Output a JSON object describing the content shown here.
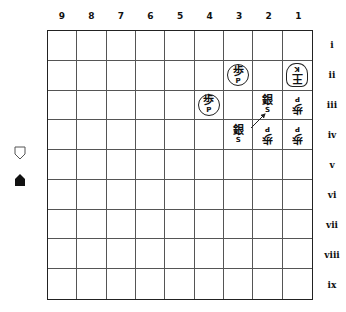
{
  "board": {
    "files": [
      "9",
      "8",
      "7",
      "6",
      "5",
      "4",
      "3",
      "2",
      "1"
    ],
    "ranks": [
      "i",
      "ii",
      "iii",
      "iv",
      "v",
      "vi",
      "vii",
      "viii",
      "ix"
    ],
    "pieces": {
      "1-ii": {
        "kanji": "王",
        "latin": "K",
        "side": "gote",
        "type": "king"
      },
      "3-ii": {
        "kanji": "歩",
        "latin": "P",
        "side": "sente",
        "type": "pawn",
        "circled": true
      },
      "4-iii": {
        "kanji": "歩",
        "latin": "P",
        "side": "sente",
        "type": "pawn",
        "circled": true
      },
      "2-iii": {
        "kanji": "銀",
        "latin": "S",
        "side": "sente",
        "type": "silver"
      },
      "1-iii": {
        "kanji": "歩",
        "latin": "P",
        "side": "gote",
        "type": "pawn"
      },
      "3-iv": {
        "kanji": "銀",
        "latin": "S",
        "side": "sente",
        "type": "silver"
      },
      "2-iv": {
        "kanji": "歩",
        "latin": "P",
        "side": "gote",
        "type": "pawn"
      },
      "1-iv": {
        "kanji": "歩",
        "latin": "P",
        "side": "gote",
        "type": "pawn"
      }
    },
    "move_arrow": {
      "from": "3-iv",
      "to": "2-iii"
    }
  },
  "hands": {
    "gote": {
      "icon": "outline-piece-icon",
      "pieces": []
    },
    "sente": {
      "icon": "filled-piece-icon",
      "pieces": []
    }
  }
}
